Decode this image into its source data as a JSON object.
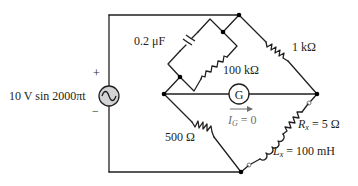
{
  "diagram": {
    "type": "ac-bridge-circuit",
    "source": {
      "label": "10 V sin 2000πt",
      "amplitude": "10 V",
      "function": "sin 2000πt",
      "plus": "+",
      "minus": "−",
      "icon": "ac-voltage-source-icon"
    },
    "components": {
      "capacitor": {
        "label": "0.2 μF"
      },
      "parallel_resistor": {
        "label": "100 kΩ"
      },
      "top_right_resistor": {
        "label": "1 kΩ"
      },
      "bottom_left_resistor": {
        "label": "500 Ω"
      },
      "rx": {
        "symbol": "R",
        "sub": "x",
        "value": " = 5 Ω"
      },
      "lx": {
        "symbol": "L",
        "sub": "x",
        "value": " = 100 mH"
      }
    },
    "galvanometer": {
      "label": "G",
      "current_symbol": "I",
      "current_sub": "G",
      "current_value": " = 0"
    },
    "colors": {
      "wire": "#231f20",
      "source_fill": "#d1d3d4",
      "annotation_gray": "#6d6e71",
      "node": "#000000"
    }
  }
}
